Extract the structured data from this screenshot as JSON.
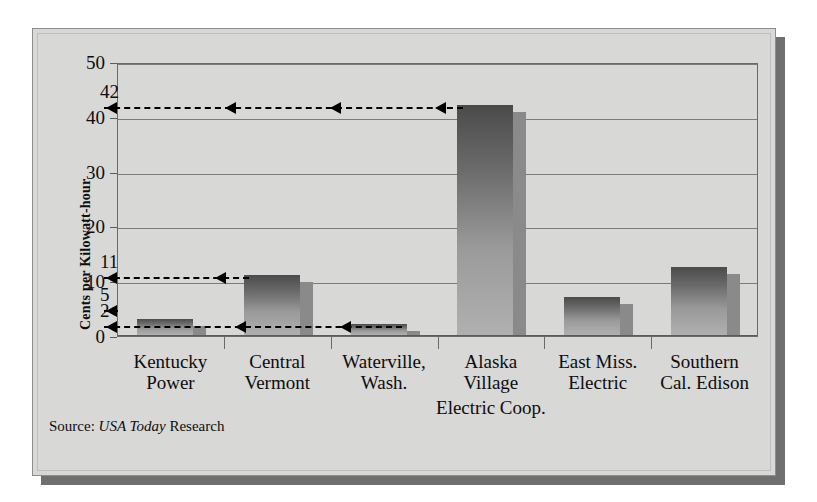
{
  "figure": {
    "background_color": "#d8d8d6",
    "frame_color": "#8d8d8d",
    "shadow_color": "#6f6f6f",
    "source_prefix": "Source: ",
    "source_italic": "USA Today",
    "source_suffix": " Research"
  },
  "chart_data": {
    "type": "bar",
    "title": "",
    "xlabel": "",
    "ylabel": "Cents per Kilowatt-hour",
    "ylim": [
      0,
      50
    ],
    "yticks": [
      0,
      10,
      20,
      30,
      40,
      50
    ],
    "ytick_labels": [
      "0",
      "10",
      "20",
      "30",
      "40",
      "50"
    ],
    "grid": true,
    "legend": "none",
    "categories": [
      "Kentucky\nPower",
      "Central\nVermont",
      "Waterville,\nWash.",
      "Alaska\nVillage",
      "East Miss.\nElectric",
      "Southern\nCal. Edison"
    ],
    "category_extra_line": "Electric Coop.",
    "values": [
      3,
      11,
      2,
      42,
      7,
      12.5
    ],
    "bar_color_top": "#4b4b4b",
    "bar_color_bottom": "#b0b0b0",
    "bar_side_color": "#8a8a8a",
    "annotations": [
      {
        "value": "42",
        "level": 42
      },
      {
        "value": "11",
        "level": 11
      },
      {
        "value": "5",
        "level": 5
      },
      {
        "value": "2",
        "level": 2
      }
    ]
  }
}
